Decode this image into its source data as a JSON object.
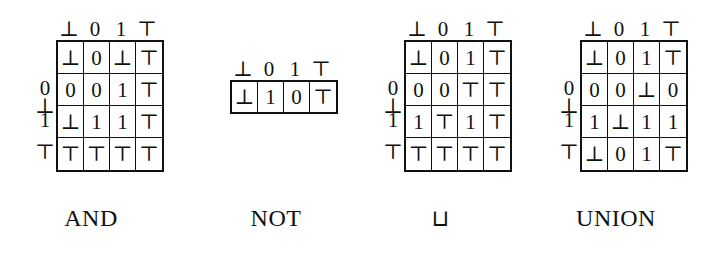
{
  "figure": {
    "values": [
      "⊥",
      "0",
      "1",
      "⊤"
    ],
    "operators": [
      {
        "id": "and",
        "caption": "AND",
        "kind": "binary",
        "col_headers": [
          "⊥",
          "0",
          "1",
          "⊤"
        ],
        "row_headers": [
          "⊥",
          "0",
          "1",
          "⊤"
        ],
        "rows": [
          [
            "⊥",
            "0",
            "⊥",
            "⊤"
          ],
          [
            "0",
            "0",
            "1",
            "⊤"
          ],
          [
            "⊥",
            "1",
            "1",
            "⊤"
          ],
          [
            "⊤",
            "⊤",
            "⊤",
            "⊤"
          ]
        ]
      },
      {
        "id": "not",
        "caption": "NOT",
        "kind": "unary",
        "col_headers": [
          "⊥",
          "0",
          "1",
          "⊤"
        ],
        "row_headers": [],
        "rows": [
          [
            "⊥",
            "1",
            "0",
            "⊤"
          ]
        ]
      },
      {
        "id": "join",
        "caption": "⊔",
        "kind": "binary",
        "col_headers": [
          "⊥",
          "0",
          "1",
          "⊤"
        ],
        "row_headers": [
          "⊥",
          "0",
          "1",
          "⊤"
        ],
        "rows": [
          [
            "⊥",
            "0",
            "1",
            "⊤"
          ],
          [
            "0",
            "0",
            "⊤",
            "⊤"
          ],
          [
            "1",
            "⊤",
            "1",
            "⊤"
          ],
          [
            "⊤",
            "⊤",
            "⊤",
            "⊤"
          ]
        ]
      },
      {
        "id": "union",
        "caption": "UNION",
        "kind": "binary",
        "col_headers": [
          "⊥",
          "0",
          "1",
          "⊤"
        ],
        "row_headers": [
          "⊥",
          "0",
          "1",
          "⊤"
        ],
        "rows": [
          [
            "⊥",
            "0",
            "1",
            "⊤"
          ],
          [
            "0",
            "0",
            "⊥",
            "0"
          ],
          [
            "1",
            "⊥",
            "1",
            "1"
          ],
          [
            "⊥",
            "0",
            "1",
            "⊤"
          ]
        ]
      }
    ]
  }
}
